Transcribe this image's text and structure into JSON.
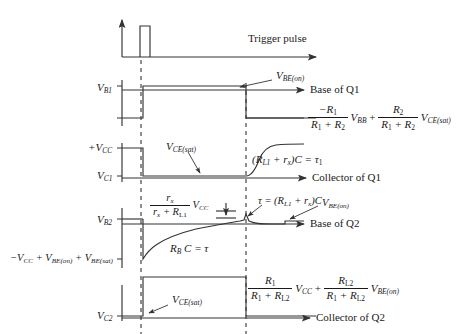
{
  "figure": {
    "title_text": "Trigger pulse",
    "stroke_color": "#333333",
    "background": "#ffffff"
  },
  "traces": [
    {
      "id": "trigger",
      "right_label": "",
      "left_labels": [],
      "annotations": [
        "Trigger pulse"
      ]
    },
    {
      "id": "base_q1",
      "right_label": "Base of Q1",
      "left_labels": [
        "V_B1"
      ],
      "annotations": [
        "V_BE(on)"
      ]
    },
    {
      "id": "collector_q1",
      "right_label": "Collector of Q1",
      "left_labels": [
        "+V_CC",
        "V_C1"
      ],
      "annotations": [
        "V_CE(sat)",
        "(R_L1 + r_x)C = tau_1"
      ]
    },
    {
      "id": "base_q2",
      "right_label": "Base of Q2",
      "left_labels": [
        "V_B2",
        "-V_CC + V_BE(on) + V_BE(sat)"
      ],
      "annotations": [
        "r_x/(r_x+R_L1) V_CC",
        "tau = (R_L1 + r_x)C",
        "V_BE(on)",
        "R_B C = tau"
      ]
    },
    {
      "id": "collector_q2",
      "right_label": "Collector of Q2",
      "left_labels": [
        "V_C2"
      ],
      "annotations": [
        "V_CE(sat)",
        "R_1/(R_1+R_L2) V_CC + R_L2/(R_1+R_L2) V_BE(on)"
      ]
    }
  ],
  "labels": {
    "trigger_pulse": "Trigger pulse",
    "base_of_q1": "Base of Q1",
    "collector_of_q1": "Collector of Q1",
    "base_of_q2": "Base of Q2",
    "collector_of_q2": "Collector of Q2",
    "v_b1": "V",
    "v_b1_sub": "B1",
    "v_c1": "V",
    "v_c1_sub": "C1",
    "v_b2": "V",
    "v_b2_sub": "B2",
    "v_c2": "V",
    "v_c2_sub": "C2",
    "plus_vcc": "+V",
    "plus_vcc_sub": "CC",
    "v_be_on_1": "V",
    "v_be_on_1_sub": "BE(on)",
    "v_be_on_2": "V",
    "v_be_on_2_sub": "BE(on)",
    "v_ce_sat_1": "V",
    "v_ce_sat_1_sub": "CE(sat)",
    "v_ce_sat_2": "V",
    "v_ce_sat_2_sub": "CE(sat)",
    "tau1_expr_a": "(R",
    "tau1_expr_a_sub": "L1",
    "tau1_expr_b": " + r",
    "tau1_expr_b_sub": "x",
    "tau1_expr_c": ")C = ",
    "tau1_expr_tau": "τ",
    "tau1_expr_tau_sub": "1",
    "tau_expr_lead": "τ = (R",
    "tau_expr_lead_sub": "L1",
    "tau_expr_mid": " + r",
    "tau_expr_mid_sub": "x",
    "tau_expr_end": ")C",
    "rbc_tau_a": "R",
    "rbc_tau_a_sub": "B",
    "rbc_tau_b": " C = ",
    "rbc_tau_tau": "τ",
    "neg_vcc_expr_a": "−V",
    "neg_vcc_expr_a_sub": "CC",
    "neg_vcc_expr_b": " + V",
    "neg_vcc_expr_b_sub": "BE(on)",
    "neg_vcc_expr_c": " + V",
    "neg_vcc_expr_c_sub": "BE(sat)"
  },
  "formulas": {
    "vb1_low": {
      "f1_num_sign": "−R",
      "f1_num_sub": "1",
      "f1_den_a": "R",
      "f1_den_a_sub": "1",
      "f1_den_plus": " + R",
      "f1_den_b_sub": "2",
      "v_bb": "V",
      "v_bb_sub": "BB",
      "plus": "+",
      "f2_num_a": "R",
      "f2_num_a_sub": "2",
      "f2_den_a": "R",
      "f2_den_a_sub": "1",
      "f2_den_plus": " + R",
      "f2_den_b_sub": "2",
      "v_ce_sat": "V",
      "v_ce_sat_sub": "CE(sat)"
    },
    "vb2_peak": {
      "num": "r",
      "num_sub": "x",
      "den_a": "r",
      "den_a_sub": "x",
      "den_plus": " + R",
      "den_b_sub": "L1",
      "v_cc": "V",
      "v_cc_sub": "CC"
    },
    "vc2_high": {
      "f1_num": "R",
      "f1_num_sub": "1",
      "f1_den_a": "R",
      "f1_den_a_sub": "1",
      "f1_den_plus": " + R",
      "f1_den_b_sub": "L2",
      "v_cc": "V",
      "v_cc_sub": "CC",
      "plus": "+",
      "f2_num": "R",
      "f2_num_sub": "L2",
      "f2_den_a": "R",
      "f2_den_a_sub": "1",
      "f2_den_plus": " + R",
      "f2_den_b_sub": "L2",
      "v_be_on": "V",
      "v_be_on_sub": "BE(on)"
    }
  }
}
